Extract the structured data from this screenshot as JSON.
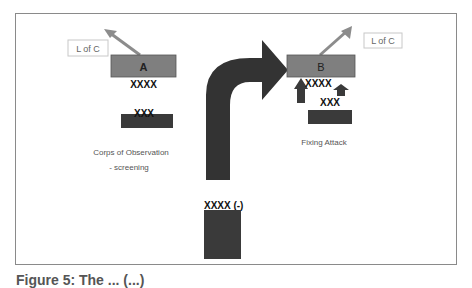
{
  "diagram": {
    "left_group": {
      "loc_label": "L of C",
      "unit_label": "A",
      "unit_size": "XXXX",
      "sub_unit_size": "XXX",
      "description_line1": "Corps of Observation",
      "description_line2": "- screening"
    },
    "right_group": {
      "loc_label": "L of C",
      "unit_label": "B",
      "unit_size": "XXXX",
      "sub_unit_size": "XXX",
      "description": "Fixing Attack"
    },
    "main_force": {
      "unit_size": "XXXX (-)"
    },
    "caption": "Figure 5: The ... (...)"
  },
  "colors": {
    "unit_box": "#7f7f7f",
    "dark_unit": "#3a3a3a",
    "arrow_gray": "#8c8c8c",
    "main_arrow": "#333333",
    "frame": "#8a8a8a"
  }
}
